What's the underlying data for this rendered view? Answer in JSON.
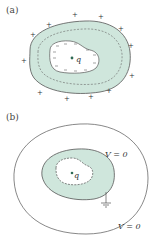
{
  "panel_a": {
    "label": "(a)",
    "charge_label": "q",
    "outer_sign": "+",
    "inner_sign": "−"
  },
  "panel_b": {
    "label": "(b)",
    "charge_label": "q",
    "inner_potential_label": "V = 0",
    "outer_potential_label": "V = 0"
  },
  "colors": {
    "conductor_fill": "#cfe6dc",
    "stroke": "#555555",
    "dash": "#666666",
    "charge_dot": "#2f6b55"
  }
}
